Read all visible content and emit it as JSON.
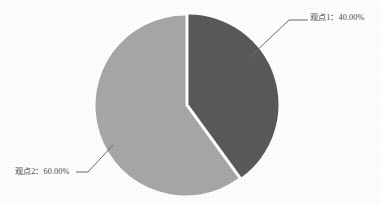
{
  "chart_data": {
    "type": "pie",
    "title": "",
    "subtitle": "",
    "xlabel": "",
    "ylabel": "",
    "grid": false,
    "legend_position": "none",
    "labels_position": "outside-with-leader-lines",
    "start_angle_deg": 0,
    "direction": "clockwise",
    "categories": [
      "观点1",
      "观点2"
    ],
    "values": [
      40.0,
      60.0
    ],
    "value_unit": "%",
    "slices": [
      {
        "name": "观点1",
        "value": 40.0,
        "percent_text": "40.00%",
        "data_label": "观点1：40.00%",
        "color": "#595959",
        "start_angle_deg": 0,
        "end_angle_deg": 144
      },
      {
        "name": "观点2",
        "value": 60.0,
        "percent_text": "60.00%",
        "data_label": "观点2：60.00%",
        "color": "#a6a6a6",
        "start_angle_deg": 144,
        "end_angle_deg": 360
      }
    ],
    "annotations": []
  },
  "colors": {
    "background": "#fdfdfd",
    "slice_dark": "#595959",
    "slice_light": "#a6a6a6",
    "leader_line": "#6b6b6b",
    "label_text": "#4a4a4a",
    "slice_gap": "#ffffff"
  },
  "labels": {
    "slice_1": "观点1：40.00%",
    "slice_2": "观点2：60.00%"
  }
}
